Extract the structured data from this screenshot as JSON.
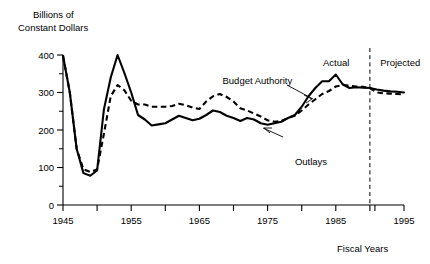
{
  "chart_data": {
    "type": "line",
    "title": "Billions of\nConstant Dollars",
    "title_line1": "Billions of",
    "title_line2": "Constant Dollars",
    "xlabel": "Fiscal Years",
    "ylabel": "Billions of Constant Dollars",
    "xlim": [
      1945,
      1995
    ],
    "ylim": [
      0,
      400
    ],
    "grid": false,
    "legend_position": "inline-annotations",
    "y_ticks": [
      0,
      100,
      200,
      300,
      400
    ],
    "y_tick_labels": [
      "0",
      "100",
      "200",
      "300",
      "400"
    ],
    "y_minor_tick_step": 50,
    "x_ticks": [
      1945,
      1950,
      1955,
      1960,
      1965,
      1970,
      1975,
      1980,
      1985,
      1990,
      1995
    ],
    "x_tick_labels": [
      "1945",
      "",
      "1955",
      "",
      "1965",
      "",
      "1975",
      "",
      "1985",
      "",
      "1995"
    ],
    "annotations": [
      {
        "name": "actual-label",
        "text": "Actual",
        "x": 1987.0,
        "y": 372
      },
      {
        "name": "projected-label",
        "text": "Projected",
        "x": 1991.5,
        "y": 372
      },
      {
        "name": "budget-authority-label",
        "text": "Budget Authority",
        "x": 1973.5,
        "y": 322
      },
      {
        "name": "outlays-label",
        "text": "Outlays",
        "x": 1979.0,
        "y": 108
      },
      {
        "name": "divider-line",
        "text": "",
        "x": 1990.0,
        "y": 0
      }
    ],
    "divider_year": 1990,
    "series": [
      {
        "name": "Budget Authority",
        "style": "solid",
        "x": [
          1945,
          1946,
          1947,
          1948,
          1949,
          1950,
          1951,
          1952,
          1953,
          1954,
          1955,
          1956,
          1957,
          1958,
          1959,
          1960,
          1961,
          1962,
          1963,
          1964,
          1965,
          1966,
          1967,
          1968,
          1969,
          1970,
          1971,
          1972,
          1973,
          1974,
          1975,
          1976,
          1977,
          1978,
          1979,
          1980,
          1981,
          1982,
          1983,
          1984,
          1985,
          1986,
          1987,
          1988,
          1989,
          1990,
          1991,
          1992,
          1993,
          1994,
          1995
        ],
        "values": [
          398,
          300,
          150,
          85,
          78,
          92,
          255,
          340,
          400,
          352,
          300,
          240,
          228,
          212,
          215,
          218,
          228,
          238,
          232,
          226,
          230,
          240,
          252,
          248,
          238,
          232,
          224,
          232,
          228,
          218,
          214,
          218,
          222,
          232,
          240,
          262,
          290,
          312,
          330,
          330,
          348,
          322,
          312,
          314,
          313,
          312,
          308,
          305,
          303,
          302,
          300
        ]
      },
      {
        "name": "Outlays",
        "style": "dashed",
        "x": [
          1945,
          1946,
          1947,
          1948,
          1949,
          1950,
          1951,
          1952,
          1953,
          1954,
          1955,
          1956,
          1957,
          1958,
          1959,
          1960,
          1961,
          1962,
          1963,
          1964,
          1965,
          1966,
          1967,
          1968,
          1969,
          1970,
          1971,
          1972,
          1973,
          1974,
          1975,
          1976,
          1977,
          1978,
          1979,
          1980,
          1981,
          1982,
          1983,
          1984,
          1985,
          1986,
          1987,
          1988,
          1989,
          1990,
          1991,
          1992,
          1993,
          1994,
          1995
        ],
        "values": [
          398,
          300,
          150,
          95,
          88,
          95,
          190,
          290,
          320,
          306,
          278,
          268,
          268,
          262,
          262,
          262,
          264,
          270,
          266,
          260,
          256,
          276,
          290,
          296,
          288,
          276,
          258,
          252,
          244,
          236,
          226,
          222,
          224,
          232,
          238,
          252,
          268,
          282,
          296,
          304,
          316,
          320,
          318,
          316,
          315,
          312,
          300,
          298,
          297,
          296,
          295
        ]
      }
    ]
  },
  "axis": {
    "y_title_line1": "Billions of",
    "y_title_line2": "Constant Dollars",
    "x_title": "Fiscal Years"
  }
}
